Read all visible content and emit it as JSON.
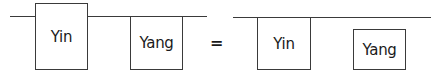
{
  "diagram": {
    "left": {
      "box1": {
        "label": "Yin"
      },
      "box2": {
        "label": "Yang"
      }
    },
    "operator": "=",
    "right": {
      "box3": {
        "label": "Yin"
      },
      "box4": {
        "label": "Yang"
      }
    }
  }
}
